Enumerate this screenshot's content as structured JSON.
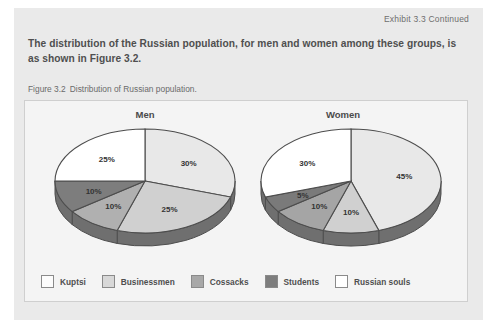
{
  "exhibit": {
    "label": "Exhibit 3.3 Continued",
    "body_text": "The distribution of the Russian population, for men and women among these groups, is as shown in Figure 3.2."
  },
  "figure": {
    "number": "Figure 3.2",
    "caption": "Distribution of Russian population."
  },
  "legend": {
    "items": [
      {
        "label": "Kuptsi",
        "color": "#fcfcfc"
      },
      {
        "label": "Businessmen",
        "color": "#d8d8d8"
      },
      {
        "label": "Cossacks",
        "color": "#a8a8a8"
      },
      {
        "label": "Students",
        "color": "#7d7d7d"
      },
      {
        "label": "Russian souls",
        "color": "#ffffff"
      }
    ]
  },
  "colors": {
    "panel_bg": "#eaeaea",
    "chart_bg": "#f4f4f4",
    "side_wall": "#6f6f6f",
    "outline": "#4d4d4d",
    "text": "#4f4f4f"
  },
  "chart_data": [
    {
      "type": "pie",
      "title": "Men",
      "categories": [
        "Kuptsi",
        "Businessmen",
        "Cossacks",
        "Students",
        "Russian souls"
      ],
      "values": [
        30,
        25,
        10,
        10,
        25
      ],
      "labels": [
        "30%",
        "25%",
        "10%",
        "10%",
        "25%"
      ],
      "colors": [
        "#e8e8e8",
        "#d0d0d0",
        "#b0b0b0",
        "#7d7d7d",
        "#ffffff"
      ],
      "unit": "%",
      "legend_position": "bottom",
      "grid": false
    },
    {
      "type": "pie",
      "title": "Women",
      "categories": [
        "Kuptsi",
        "Businessmen",
        "Cossacks",
        "Students",
        "Russian souls"
      ],
      "values": [
        45,
        10,
        10,
        5,
        30
      ],
      "labels": [
        "45%",
        "10%",
        "10%",
        "5%",
        "30%"
      ],
      "colors": [
        "#e8e8e8",
        "#d0d0d0",
        "#a5a5a5",
        "#7a7a7a",
        "#ffffff"
      ],
      "unit": "%",
      "legend_position": "bottom",
      "grid": false
    }
  ]
}
